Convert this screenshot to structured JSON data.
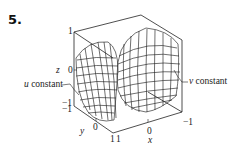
{
  "problem": {
    "number": "5."
  },
  "axes": {
    "z": {
      "label": "z",
      "ticks": [
        "1",
        "0",
        "−1"
      ]
    },
    "y": {
      "label": "y",
      "ticks": [
        "−1",
        "0",
        "1"
      ]
    },
    "x": {
      "label": "x",
      "ticks": [
        "1",
        "0",
        "−1"
      ]
    }
  },
  "annotations": {
    "u_constant": {
      "var": "u",
      "text": "constant"
    },
    "v_constant": {
      "var": "v",
      "text": "constant"
    }
  },
  "colors": {
    "line": "#222222",
    "background": "#ffffff"
  }
}
